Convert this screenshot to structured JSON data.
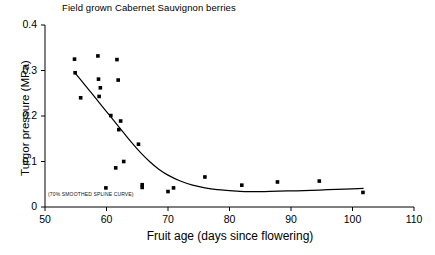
{
  "chart_data": {
    "type": "scatter",
    "title": "Field grown Cabernet Sauvignon berries",
    "xlabel": "Fruit age (days since flowering)",
    "ylabel": "Turgor pressure (MPa)",
    "xlim": [
      50,
      110
    ],
    "ylim": [
      0,
      0.4
    ],
    "xticks": [
      "50",
      "60",
      "70",
      "80",
      "90",
      "100",
      "110"
    ],
    "xtick_values": [
      50,
      60,
      70,
      80,
      90,
      100,
      110
    ],
    "yticks": [
      "0",
      "0.1",
      "0.2",
      "0.3",
      "0.4"
    ],
    "ytick_values": [
      0,
      0.1,
      0.2,
      0.3,
      0.4
    ],
    "grid": false,
    "legend": null,
    "annotation": "(70% SMOOTHED SPLINE CURVE)",
    "marker_color": "#000000",
    "line_color": "#000000",
    "axis_color": "#000000",
    "background_color": "#ffffff",
    "series": [
      {
        "name": "Turgor pressure measurements",
        "type": "scatter",
        "points": [
          [
            54.8,
            0.325
          ],
          [
            54.9,
            0.295
          ],
          [
            55.8,
            0.24
          ],
          [
            58.6,
            0.332
          ],
          [
            58.7,
            0.281
          ],
          [
            59.0,
            0.262
          ],
          [
            58.8,
            0.243
          ],
          [
            61.7,
            0.324
          ],
          [
            61.9,
            0.279
          ],
          [
            60.7,
            0.201
          ],
          [
            62.3,
            0.189
          ],
          [
            62.0,
            0.17
          ],
          [
            65.2,
            0.138
          ],
          [
            62.8,
            0.1
          ],
          [
            61.5,
            0.086
          ],
          [
            59.9,
            0.042
          ],
          [
            65.8,
            0.049
          ],
          [
            65.8,
            0.043
          ],
          [
            70.0,
            0.034
          ],
          [
            70.9,
            0.042
          ],
          [
            76.0,
            0.066
          ],
          [
            82.0,
            0.048
          ],
          [
            87.8,
            0.055
          ],
          [
            94.6,
            0.057
          ],
          [
            101.7,
            0.032
          ]
        ]
      },
      {
        "name": "70% smoothed spline curve",
        "type": "line",
        "points": [
          [
            54.8,
            0.296
          ],
          [
            56.5,
            0.268
          ],
          [
            58.0,
            0.243
          ],
          [
            59.5,
            0.218
          ],
          [
            61.0,
            0.193
          ],
          [
            62.5,
            0.168
          ],
          [
            64.0,
            0.143
          ],
          [
            65.5,
            0.12
          ],
          [
            67.0,
            0.1
          ],
          [
            68.5,
            0.083
          ],
          [
            70.0,
            0.07
          ],
          [
            72.0,
            0.057
          ],
          [
            74.0,
            0.048
          ],
          [
            76.0,
            0.042
          ],
          [
            78.0,
            0.038
          ],
          [
            80.0,
            0.036
          ],
          [
            82.5,
            0.034
          ],
          [
            85.0,
            0.034
          ],
          [
            88.0,
            0.035
          ],
          [
            92.0,
            0.036
          ],
          [
            96.0,
            0.038
          ],
          [
            100.0,
            0.04
          ],
          [
            101.8,
            0.041
          ]
        ]
      }
    ]
  }
}
